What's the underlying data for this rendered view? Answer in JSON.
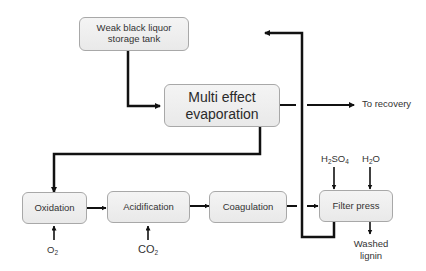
{
  "diagram": {
    "nodes": {
      "storage_tank": {
        "label_line1": "Weak black liquor",
        "label_line2": "storage tank"
      },
      "evaporation": {
        "label_line1": "Multi effect",
        "label_line2": "evaporation"
      },
      "oxidation": {
        "label": "Oxidation"
      },
      "acidification": {
        "label": "Acidification"
      },
      "coagulation": {
        "label": "Coagulation"
      },
      "filter_press": {
        "label": "Filter press"
      }
    },
    "labels": {
      "to_recovery": "To recovery",
      "o2": {
        "base": "O",
        "sub": "2"
      },
      "co2": {
        "base": "CO",
        "sub": "2"
      },
      "h2so4": {
        "p1": "H",
        "s1": "2",
        "p2": "SO",
        "s2": "4"
      },
      "h2o": {
        "p1": "H",
        "s1": "2",
        "p2": "O"
      },
      "washed_lignin_line1": "Washed",
      "washed_lignin_line2": "lignin"
    },
    "colors": {
      "line": "#111111",
      "box_fill": "#efefef",
      "box_border": "#a8a8a8",
      "text": "#333333"
    }
  }
}
